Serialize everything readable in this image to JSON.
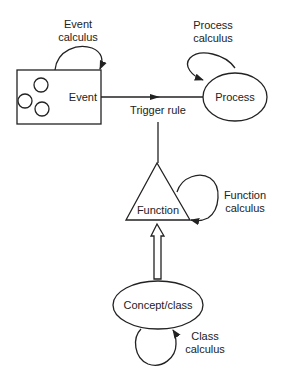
{
  "diagram": {
    "nodes": {
      "event": {
        "label": "Event",
        "shape": "rectangle"
      },
      "process": {
        "label": "Process",
        "shape": "ellipse"
      },
      "function": {
        "label": "Function",
        "shape": "triangle"
      },
      "concept": {
        "label": "Concept/class",
        "shape": "ellipse"
      }
    },
    "loops": {
      "event": {
        "line1": "Event",
        "line2": "calculus"
      },
      "process": {
        "line1": "Process",
        "line2": "calculus"
      },
      "function": {
        "line1": "Function",
        "line2": "calculus"
      },
      "concept": {
        "line1": "Class",
        "line2": "calculus"
      }
    },
    "edges": {
      "trigger": {
        "label": "Trigger rule",
        "from": "event",
        "to": "process"
      },
      "function_link": {
        "from": "function",
        "to": "trigger"
      },
      "concept_to_function": {
        "from": "concept",
        "to": "function",
        "style": "hollow-arrow"
      }
    },
    "colors": {
      "line": "#222222",
      "background": "#ffffff"
    }
  }
}
